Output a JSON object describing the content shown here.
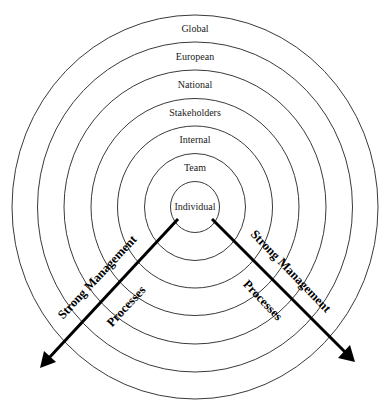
{
  "diagram": {
    "type": "concentric-circles",
    "center": {
      "x": 195,
      "y": 207
    },
    "rings": [
      {
        "label": "Individual",
        "rx": 24.5,
        "ry": 25.5,
        "label_y": 208
      },
      {
        "label": "Team",
        "rx": 50.5,
        "ry": 53.5,
        "label_y": 169
      },
      {
        "label": "Internal",
        "rx": 77.5,
        "ry": 81,
        "label_y": 141
      },
      {
        "label": "Stakeholders",
        "rx": 104,
        "ry": 108.5,
        "label_y": 114
      },
      {
        "label": "National",
        "rx": 131,
        "ry": 137,
        "label_y": 86
      },
      {
        "label": "European",
        "rx": 157.5,
        "ry": 165,
        "label_y": 58
      },
      {
        "label": "Global",
        "rx": 183,
        "ry": 192,
        "label_y": 30
      }
    ],
    "arrows": [
      {
        "side": "left",
        "from": {
          "x": 178,
          "y": 219
        },
        "to": {
          "x": 40,
          "y": 368
        },
        "label_top": "Strong Management",
        "label_bottom": "Processes"
      },
      {
        "side": "right",
        "from": {
          "x": 212,
          "y": 219
        },
        "to": {
          "x": 355,
          "y": 362
        },
        "label_top": "Strong Management",
        "label_bottom": "Processes"
      }
    ],
    "colors": {
      "ring_stroke": "#3a3a3a",
      "arrow": "#000000",
      "background": "#ffffff"
    }
  }
}
